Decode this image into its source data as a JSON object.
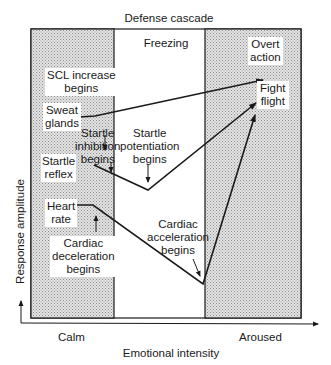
{
  "title": "Defense cascade",
  "zones": {
    "freezing": "Freezing",
    "overt_action": [
      "Overt",
      "action"
    ]
  },
  "axes": {
    "y_label": "Response amplitude",
    "x_label": "Emotional intensity",
    "x_left": "Calm",
    "x_right": "Aroused"
  },
  "labels": {
    "scl": [
      "SCL increase",
      "begins"
    ],
    "sweat": [
      "Sweat",
      "glands"
    ],
    "startle_inhib": [
      "Startle",
      "inhibition",
      "begins"
    ],
    "startle_reflex": [
      "Startle",
      "reflex"
    ],
    "startle_pot": [
      "Startle",
      "potentiation",
      "begins"
    ],
    "heart": [
      "Heart",
      "rate"
    ],
    "cardiac_decel": [
      "Cardiac",
      "deceleration",
      "begins"
    ],
    "cardiac_accel": [
      "Cardiac",
      "acceleration",
      "begins"
    ],
    "fight": [
      "Fight",
      "flight"
    ]
  },
  "colors": {
    "shade": "#d4d4d4",
    "line": "#1a1a1a"
  }
}
